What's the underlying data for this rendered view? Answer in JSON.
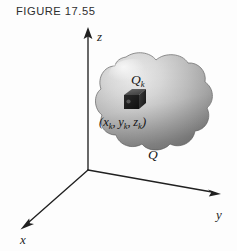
{
  "figure": {
    "caption": "FIGURE 17.55",
    "background_color": "#fdfdfd",
    "ink_color": "#202020"
  },
  "axes": {
    "origin": {
      "x": 88,
      "y": 170
    },
    "items": [
      {
        "name": "z",
        "label": "z",
        "label_x": 97,
        "label_y": 41,
        "tip_x": 88,
        "tip_y": 29
      },
      {
        "name": "y",
        "label": "y",
        "label_x": 219,
        "label_y": 218,
        "tip_x": 219,
        "tip_y": 194
      },
      {
        "name": "x",
        "label": "x",
        "label_x": 24,
        "label_y": 243,
        "tip_x": 21,
        "tip_y": 228
      }
    ]
  },
  "solid": {
    "name": "solid-region-q",
    "label": "Q",
    "label_x": 148,
    "label_y": 158,
    "fill_light": "#e6e6e6",
    "fill_mid": "#bdbdbd",
    "fill_dark": "#8e8e8e",
    "outline_color": "#6f6f6f",
    "center_x": 155,
    "center_y": 106
  },
  "cell": {
    "name": "sample-cell-qk",
    "label": "Q",
    "label_subscript": "k",
    "label_x": 137,
    "label_y": 83,
    "top_face": "#5a5a5a",
    "front_face": "#1b1b1b",
    "side_face": "#3a3a3a",
    "x": 124,
    "y": 92,
    "size": 15
  },
  "sample_point": {
    "name": "sample-point-coordinates",
    "open_paren": "(",
    "x_var": "x",
    "x_sub": "k",
    "comma1": ",",
    "y_var": "y",
    "y_sub": "k",
    "comma2": ",",
    "z_var": "z",
    "z_sub": "k",
    "close_paren": ")",
    "label_x": 99,
    "label_y": 125
  }
}
